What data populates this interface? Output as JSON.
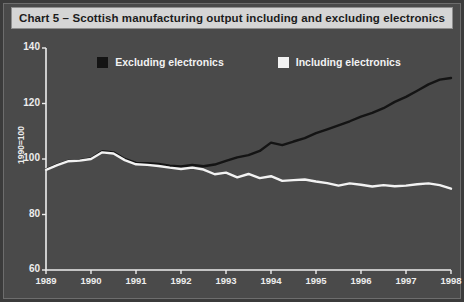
{
  "title": "Chart 5 – Scottish manufacturing output including and excluding electronics",
  "colors": {
    "background": "#4a4a4a",
    "frame": "#3b3b3b",
    "title_bar": "#d5d5d5",
    "title_text": "#1c1c1c",
    "axis": "#ededed",
    "tick_text": "#ededed",
    "excluding": "#141414",
    "including": "#f2f2f2"
  },
  "legend": {
    "items": [
      {
        "label": "Excluding electronics",
        "color": "#141414"
      },
      {
        "label": "Including electronics",
        "color": "#f2f2f2"
      }
    ]
  },
  "chart_data": {
    "type": "line",
    "title": "Chart 5 – Scottish manufacturing output including and excluding electronics",
    "xlabel": "",
    "ylabel": "1990=100",
    "ylim": [
      60,
      140
    ],
    "yticks": [
      60,
      80,
      100,
      120,
      140
    ],
    "xlim": [
      1989,
      1998
    ],
    "xticks": [
      "1989",
      "1990",
      "1991",
      "1992",
      "1993",
      "1994",
      "1995",
      "1996",
      "1997",
      "1998"
    ],
    "grid": false,
    "legend_position": "top",
    "x": [
      1989.0,
      1989.25,
      1989.5,
      1989.75,
      1990.0,
      1990.25,
      1990.5,
      1990.75,
      1991.0,
      1991.25,
      1991.5,
      1991.75,
      1992.0,
      1992.25,
      1992.5,
      1992.75,
      1993.0,
      1993.25,
      1993.5,
      1993.75,
      1994.0,
      1994.25,
      1994.5,
      1994.75,
      1995.0,
      1995.25,
      1995.5,
      1995.75,
      1996.0,
      1996.25,
      1996.5,
      1996.75,
      1997.0,
      1997.25,
      1997.5,
      1997.75,
      1998.0
    ],
    "series": [
      {
        "name": "Excluding electronics",
        "color": "#141414",
        "values": [
          96.3,
          98.0,
          99.3,
          99.6,
          100.2,
          102.8,
          102.4,
          100.0,
          98.6,
          98.5,
          98.2,
          97.6,
          97.3,
          97.9,
          97.4,
          98.0,
          99.3,
          100.6,
          101.4,
          102.9,
          105.9,
          105.0,
          106.3,
          107.5,
          109.3,
          110.7,
          112.1,
          113.6,
          115.3,
          116.6,
          118.3,
          120.6,
          122.4,
          124.6,
          126.9,
          128.6,
          129.2
        ]
      },
      {
        "name": "Including electronics",
        "color": "#f2f2f2",
        "values": [
          96.1,
          97.8,
          99.2,
          99.4,
          100.0,
          102.4,
          102.0,
          99.6,
          98.1,
          97.9,
          97.5,
          96.9,
          96.4,
          96.9,
          96.2,
          94.5,
          95.1,
          93.4,
          94.6,
          93.1,
          93.8,
          92.1,
          92.4,
          92.6,
          91.9,
          91.3,
          90.4,
          91.2,
          90.7,
          90.1,
          90.6,
          90.2,
          90.4,
          90.9,
          91.2,
          90.6,
          89.3
        ]
      }
    ]
  }
}
